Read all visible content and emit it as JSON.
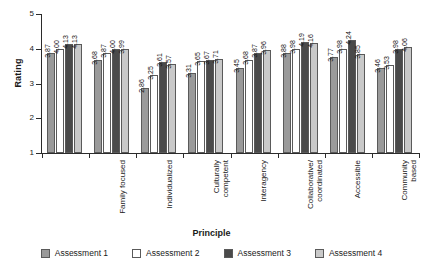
{
  "chart_data": {
    "type": "bar",
    "title": "",
    "xlabel": "Principle",
    "ylabel": "Rating",
    "ylim": [
      1,
      5
    ],
    "yticks": [
      1,
      2,
      3,
      4,
      5
    ],
    "grid": false,
    "legend_position": "bottom",
    "categories": [
      "Family focused",
      "Individualized",
      "Culturally\ncompetent",
      "Interagency",
      "Collaborative/\ncoordinated",
      "Accessible",
      "Community\nbased",
      "Least restrictive"
    ],
    "series": [
      {
        "name": "Assessment 1",
        "color": "#9a9a9a",
        "values": [
          3.87,
          3.68,
          2.86,
          3.31,
          3.45,
          3.88,
          3.77,
          3.46
        ]
      },
      {
        "name": "Assessment 2",
        "color": "#ffffff",
        "values": [
          4.0,
          3.87,
          3.25,
          3.65,
          3.68,
          3.98,
          3.98,
          3.53
        ]
      },
      {
        "name": "Assessment 3",
        "color": "#4a4a4a",
        "values": [
          4.13,
          4.0,
          3.61,
          3.67,
          3.87,
          4.19,
          4.24,
          3.98
        ]
      },
      {
        "name": "Assessment 4",
        "color": "#c9c9c9",
        "values": [
          4.13,
          3.99,
          3.57,
          3.71,
          3.96,
          4.16,
          3.85,
          4.06
        ]
      }
    ],
    "value_labels": [
      [
        "3.87",
        "4.00",
        "4.13",
        "4.13"
      ],
      [
        "3.68",
        "3.87",
        "4.00",
        "3.99"
      ],
      [
        "2.86",
        "3.25",
        "3.61",
        "3.57"
      ],
      [
        "3.31",
        "3.65",
        "3.67",
        "3.71"
      ],
      [
        "3.45",
        "3.68",
        "3.87",
        "3.96"
      ],
      [
        "3.88",
        "3.98",
        "4.19",
        "4.16"
      ],
      [
        "3.77",
        "3.98",
        "4.24",
        "3.85"
      ],
      [
        "3.46",
        "3.53",
        "3.98",
        "4.06"
      ]
    ]
  }
}
